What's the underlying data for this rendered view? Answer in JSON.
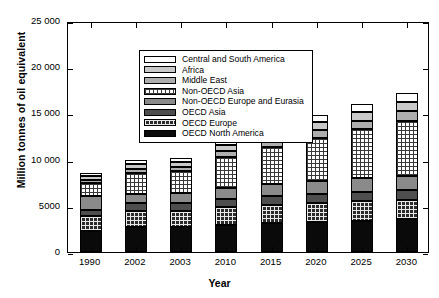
{
  "chart_data": {
    "type": "bar",
    "stacked": true,
    "title": "",
    "xlabel": "Year",
    "ylabel": "Million tonnes of oil equivalent",
    "categories": [
      "1990",
      "2002",
      "2003",
      "2010",
      "2015",
      "2020",
      "2025",
      "2030"
    ],
    "ylim": [
      0,
      25000
    ],
    "yticks": [
      0,
      5000,
      10000,
      15000,
      20000,
      25000
    ],
    "ytick_labels": [
      "0",
      "5000",
      "10 000",
      "15 000",
      "20 000",
      "25 000"
    ],
    "grid": false,
    "legend_position": "top-left inside",
    "series": [
      {
        "name": "OECD North America",
        "fill": "black",
        "values": [
          2260,
          2680,
          2700,
          2950,
          3120,
          3270,
          3410,
          3540
        ]
      },
      {
        "name": "OECD Europe",
        "fill": "grid-dark",
        "values": [
          1630,
          1760,
          1790,
          1900,
          1980,
          2040,
          2090,
          2130
        ]
      },
      {
        "name": "OECD Asia",
        "fill": "dark-gray",
        "values": [
          660,
          840,
          850,
          930,
          980,
          1010,
          1040,
          1060
        ]
      },
      {
        "name": "Non-OECD Europe and Eurasia",
        "fill": "medium-gray",
        "values": [
          1480,
          1030,
          1050,
          1200,
          1290,
          1380,
          1460,
          1530
        ]
      },
      {
        "name": "Non-OECD Asia",
        "fill": "grid-light",
        "values": [
          1490,
          2230,
          2350,
          3350,
          4010,
          4660,
          5290,
          5930
        ]
      },
      {
        "name": "Middle East",
        "fill": "light-gray",
        "values": [
          300,
          450,
          470,
          610,
          720,
          830,
          940,
          1050
        ]
      },
      {
        "name": "Africa",
        "fill": "lighter-gray",
        "values": [
          390,
          520,
          530,
          640,
          730,
          830,
          930,
          1040
        ]
      },
      {
        "name": "Central and South America",
        "fill": "white",
        "values": [
          330,
          450,
          460,
          580,
          670,
          760,
          870,
          970
        ]
      }
    ],
    "totals": [
      8540,
      9960,
      10200,
      12160,
      13500,
      14780,
      16030,
      17250
    ],
    "colors": {
      "white": "#ffffff",
      "lighter-gray": "#c9c9c9",
      "light-gray": "#aeaeae",
      "grid-light": "#ffffff",
      "medium-gray": "#8a8a8a",
      "dark-gray": "#4e4e4e",
      "grid-dark": "#2b2b2b",
      "black": "#0a0a0a"
    }
  },
  "legend": {
    "items": [
      {
        "label": "Central and South America",
        "fill": "white"
      },
      {
        "label": "Africa",
        "fill": "lighter-gray"
      },
      {
        "label": "Middle East",
        "fill": "light-gray"
      },
      {
        "label": "Non-OECD Asia",
        "fill": "grid-light"
      },
      {
        "label": "Non-OECD Europe and Eurasia",
        "fill": "medium-gray"
      },
      {
        "label": "OECD Asia",
        "fill": "dark-gray"
      },
      {
        "label": "OECD Europe",
        "fill": "grid-dark"
      },
      {
        "label": "OECD North America",
        "fill": "black"
      }
    ]
  }
}
